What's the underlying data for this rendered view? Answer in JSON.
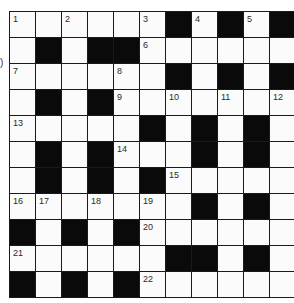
{
  "side_text": ")",
  "puzzle": {
    "rows": 11,
    "cols": 11,
    "grid": [
      "..........#.#.#",
      "x"
    ],
    "layout": [
      [
        "W",
        "W",
        "W",
        "W",
        "W",
        "W",
        "B",
        "W",
        "B",
        "W",
        "B"
      ],
      [
        "W",
        "B",
        "W",
        "B",
        "B",
        "W",
        "W",
        "W",
        "W",
        "W",
        "W"
      ],
      [
        "W",
        "W",
        "W",
        "W",
        "W",
        "W",
        "B",
        "W",
        "B",
        "W",
        "B"
      ],
      [
        "W",
        "B",
        "W",
        "B",
        "W",
        "W",
        "W",
        "W",
        "W",
        "W",
        "W"
      ],
      [
        "W",
        "W",
        "W",
        "W",
        "W",
        "B",
        "W",
        "B",
        "W",
        "B",
        "W"
      ],
      [
        "W",
        "B",
        "W",
        "B",
        "W",
        "W",
        "W",
        "B",
        "W",
        "B",
        "W"
      ],
      [
        "W",
        "B",
        "W",
        "B",
        "W",
        "B",
        "W",
        "W",
        "W",
        "W",
        "W"
      ],
      [
        "W",
        "W",
        "W",
        "W",
        "W",
        "W",
        "W",
        "B",
        "W",
        "B",
        "W"
      ],
      [
        "B",
        "W",
        "B",
        "W",
        "B",
        "W",
        "W",
        "W",
        "W",
        "W",
        "W"
      ],
      [
        "W",
        "W",
        "W",
        "W",
        "W",
        "W",
        "B",
        "B",
        "W",
        "B",
        "W"
      ],
      [
        "B",
        "W",
        "B",
        "W",
        "B",
        "W",
        "W",
        "W",
        "W",
        "W",
        "W"
      ]
    ],
    "numbers": [
      {
        "row": 0,
        "col": 0,
        "n": "1"
      },
      {
        "row": 0,
        "col": 2,
        "n": "2"
      },
      {
        "row": 0,
        "col": 5,
        "n": "3"
      },
      {
        "row": 0,
        "col": 7,
        "n": "4"
      },
      {
        "row": 0,
        "col": 9,
        "n": "5"
      },
      {
        "row": 1,
        "col": 5,
        "n": "6"
      },
      {
        "row": 2,
        "col": 0,
        "n": "7"
      },
      {
        "row": 2,
        "col": 4,
        "n": "8"
      },
      {
        "row": 3,
        "col": 4,
        "n": "9"
      },
      {
        "row": 3,
        "col": 6,
        "n": "10"
      },
      {
        "row": 3,
        "col": 8,
        "n": "11"
      },
      {
        "row": 3,
        "col": 10,
        "n": "12"
      },
      {
        "row": 4,
        "col": 0,
        "n": "13"
      },
      {
        "row": 5,
        "col": 4,
        "n": "14"
      },
      {
        "row": 6,
        "col": 6,
        "n": "15"
      },
      {
        "row": 7,
        "col": 0,
        "n": "16"
      },
      {
        "row": 7,
        "col": 1,
        "n": "17"
      },
      {
        "row": 7,
        "col": 3,
        "n": "18"
      },
      {
        "row": 7,
        "col": 5,
        "n": "19"
      },
      {
        "row": 8,
        "col": 5,
        "n": "20"
      },
      {
        "row": 9,
        "col": 0,
        "n": "21"
      },
      {
        "row": 10,
        "col": 5,
        "n": "22"
      }
    ]
  },
  "colors": {
    "black_square": "#0a0a0a",
    "white_square": "#fbfbfb",
    "grid_line": "#1a1a1a",
    "number_text": "#2a2a2a"
  }
}
